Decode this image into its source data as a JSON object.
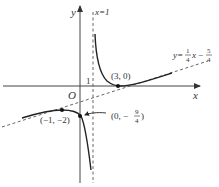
{
  "figure": {
    "type": "function-graph",
    "colors": {
      "axis": "#444444",
      "curve": "#222222",
      "dashed": "#555555",
      "text": "#333333",
      "background": "#ffffff"
    },
    "axes": {
      "x_label": "x",
      "y_label": "y",
      "origin_label": "O",
      "tick_label_one": "1"
    },
    "vertical_asymptote": {
      "label": "x=1"
    },
    "oblique_asymptote": {
      "label_prefix": "y=",
      "coef_num": "1",
      "coef_den": "4",
      "var": "x",
      "minus": "−",
      "const_num": "5",
      "const_den": "4"
    },
    "points": [
      {
        "label": "(3, 0)"
      },
      {
        "label": "(−1, −2)"
      },
      {
        "label_prefix": "(0, −",
        "frac_num": "9",
        "frac_den": "4",
        "label_suffix": ")"
      }
    ]
  }
}
